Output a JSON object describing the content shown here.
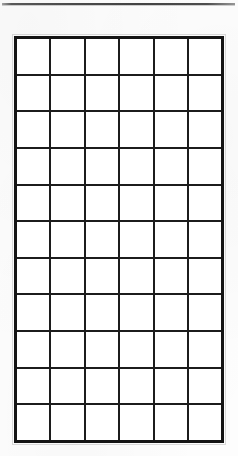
{
  "document": {
    "type": "blank-grid-worksheet",
    "title": "",
    "background_color": "#fdfdfd",
    "page_width": 238,
    "page_height": 456
  },
  "top_rule": {
    "name": "horizontal-rule",
    "color": "#3a3a3a",
    "thickness": 2,
    "x": 2,
    "y": 3,
    "width": 233
  },
  "grid": {
    "columns": 6,
    "rows": 11,
    "x": 14,
    "y": 36,
    "width": 210,
    "height": 407,
    "cell_width": 35,
    "cell_height": 37,
    "outer_border_color": "#141414",
    "outer_border_width": 3,
    "inner_line_color": "#1c1c1c",
    "inner_line_width": 2,
    "cell_fill": "#ffffff",
    "cell_text": "",
    "row_labels": [],
    "column_headers": [],
    "cells": [
      [
        "",
        "",
        "",
        "",
        "",
        ""
      ],
      [
        "",
        "",
        "",
        "",
        "",
        ""
      ],
      [
        "",
        "",
        "",
        "",
        "",
        ""
      ],
      [
        "",
        "",
        "",
        "",
        "",
        ""
      ],
      [
        "",
        "",
        "",
        "",
        "",
        ""
      ],
      [
        "",
        "",
        "",
        "",
        "",
        ""
      ],
      [
        "",
        "",
        "",
        "",
        "",
        ""
      ],
      [
        "",
        "",
        "",
        "",
        "",
        ""
      ],
      [
        "",
        "",
        "",
        "",
        "",
        ""
      ],
      [
        "",
        "",
        "",
        "",
        "",
        ""
      ],
      [
        "",
        "",
        "",
        "",
        "",
        ""
      ]
    ]
  }
}
